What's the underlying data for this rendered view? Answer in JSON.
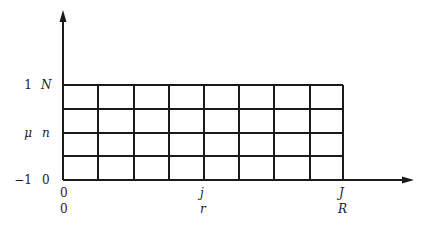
{
  "diagram": {
    "type": "grid-mesh",
    "colors": {
      "line": "#1a1a1a",
      "background": "#ffffff"
    },
    "grid": {
      "columns": 8,
      "rows": 4,
      "x_lines_px": [
        63,
        98,
        134,
        169,
        204,
        239,
        274,
        310,
        343
      ],
      "y_lines_px": [
        85,
        109,
        133,
        156,
        180
      ]
    },
    "y_axis": {
      "value_labels": [
        {
          "text": "1",
          "y": 85
        },
        {
          "text": "μ",
          "y": 133
        },
        {
          "text": "−1",
          "y": 180
        }
      ],
      "index_labels": [
        {
          "text": "N",
          "y": 85
        },
        {
          "text": "n",
          "y": 133
        },
        {
          "text": "0",
          "y": 180
        }
      ]
    },
    "x_axis": {
      "index_labels": [
        {
          "text": "0",
          "x": 63
        },
        {
          "text": "j",
          "x": 204
        },
        {
          "text": "J",
          "x": 343
        }
      ],
      "value_labels": [
        {
          "text": "0",
          "x": 63
        },
        {
          "text": "r",
          "x": 204
        },
        {
          "text": "R",
          "x": 343
        }
      ]
    }
  }
}
